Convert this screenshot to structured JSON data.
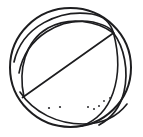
{
  "artwork": {
    "title": "Beach ball",
    "subject": "beach-ball",
    "style": "line-art",
    "description": "Monochrome outline drawing of a beach ball with curved panel seams converging near the upper-right pole, one straight diagonal seam, and small stipple dots along the lower area.",
    "canvas": {
      "width": 143,
      "height": 137,
      "background_color": "#ffffff"
    },
    "ink": {
      "line_color": "#1d1d1f",
      "dot_color": "#2a2a2c",
      "outer_stroke_width": 2.0,
      "seam_stroke_width": 1.7,
      "thin_stroke_width": 1.3
    },
    "ball": {
      "center_x": 70.5,
      "center_y": 67.5,
      "radius_x": 60.5,
      "radius_y": 59.5,
      "pole_x": 113,
      "pole_y": 33
    },
    "shapes": [
      {
        "name": "outer-circle",
        "type": "ellipse",
        "cx": 70.5,
        "cy": 67.5,
        "rx": 60.5,
        "ry": 59.5,
        "stroke_width": 2.0
      },
      {
        "name": "seam-upper-outer",
        "type": "path",
        "d": "M 14 62 C 22 26 60 9 92 14 C 104 16 111 24 113.5 33",
        "stroke_width": 1.7
      },
      {
        "name": "seam-upper-inner",
        "type": "path",
        "d": "M 19 73 C 26 36 61 17 93 22 C 105 25 112 29 113.5 33",
        "stroke_width": 1.6
      },
      {
        "name": "seam-left-lobe",
        "type": "path",
        "d": "M 24 97 C 18 70 25 41 48 28 C 70 16 97 21 113.5 33",
        "stroke_width": 1.6
      },
      {
        "name": "seam-diagonal",
        "type": "line",
        "x1": 22.5,
        "y1": 97.5,
        "x2": 113.5,
        "y2": 33,
        "stroke_width": 1.7
      },
      {
        "name": "seam-right-outer",
        "type": "path",
        "d": "M 113.5 33 C 124 47 129 70 124 92 C 120 108 110 119 99 125",
        "stroke_width": 1.7
      },
      {
        "name": "seam-right-inner",
        "type": "path",
        "d": "M 113.5 33 C 118 50 120 73 113 93 C 107 110 95 121 82 126",
        "stroke_width": 1.6
      },
      {
        "name": "seam-lower-band",
        "type": "path",
        "d": "M 20 92 C 34 113 58 124 83 124 C 102 124 117 117 127 104",
        "stroke_width": 1.6
      }
    ],
    "stipple_dots": [
      {
        "name": "dot-1",
        "cx": 49,
        "cy": 108,
        "r": 1.1
      },
      {
        "name": "dot-2",
        "cx": 60,
        "cy": 107,
        "r": 1.1
      },
      {
        "name": "dot-3",
        "cx": 88,
        "cy": 107,
        "r": 1.0
      },
      {
        "name": "dot-4",
        "cx": 94,
        "cy": 109,
        "r": 1.0
      },
      {
        "name": "dot-5",
        "cx": 99,
        "cy": 106,
        "r": 1.0
      },
      {
        "name": "dot-6",
        "cx": 104,
        "cy": 101,
        "r": 0.9
      },
      {
        "name": "dot-7",
        "cx": 110,
        "cy": 98,
        "r": 0.9
      }
    ]
  }
}
